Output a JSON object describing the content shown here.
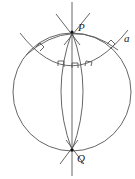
{
  "diagram": {
    "labels": {
      "top_pole": "P",
      "bottom_pole": "Q",
      "arc": "a"
    }
  }
}
